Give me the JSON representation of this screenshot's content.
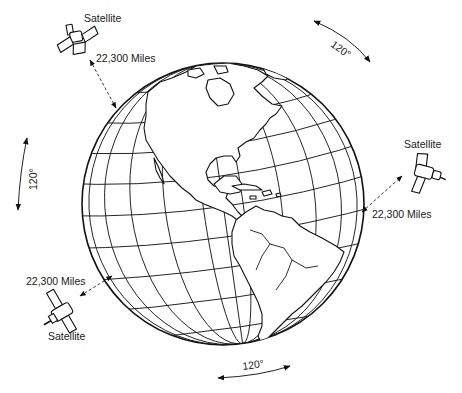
{
  "diagram": {
    "globe": {
      "view": "Western hemisphere (North and South America)",
      "center": [
        223,
        204
      ],
      "radius": 141
    },
    "satellites": [
      {
        "id": "top-left",
        "label": "Satellite",
        "distance_label": "22,300 Miles"
      },
      {
        "id": "right",
        "label": "Satellite",
        "distance_label": "22,300 Miles"
      },
      {
        "id": "bottom-left",
        "label": "Satellite",
        "distance_label": "22,300 Miles"
      }
    ],
    "angle_markers": [
      {
        "id": "top-right",
        "label": "120°"
      },
      {
        "id": "left",
        "label": "120°"
      },
      {
        "id": "bottom",
        "label": "120°"
      }
    ],
    "colors": {
      "ink": "#1a1a1a",
      "background": "#ffffff"
    }
  }
}
